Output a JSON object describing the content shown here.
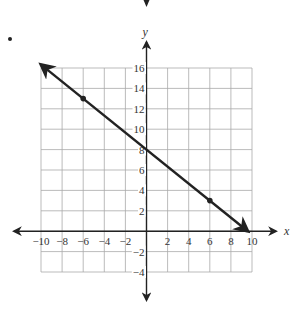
{
  "chart_data": {
    "type": "line",
    "title": "",
    "xlabel": "x",
    "ylabel": "y",
    "xlim": [
      -10,
      10
    ],
    "ylim": [
      -4,
      16
    ],
    "grid": true,
    "x_ticks": [
      -10,
      -8,
      -6,
      -4,
      -2,
      2,
      4,
      6,
      8,
      10
    ],
    "y_ticks": [
      -4,
      -2,
      2,
      4,
      6,
      8,
      10,
      12,
      14,
      16
    ],
    "x_tick_labels": [
      "−10",
      "−8",
      "−6",
      "−4",
      "−2",
      "2",
      "4",
      "6",
      "8",
      "10"
    ],
    "y_tick_labels": [
      "−4",
      "−2",
      "2",
      "4",
      "6",
      "8",
      "10",
      "12",
      "14",
      "16"
    ],
    "series": [
      {
        "name": "line",
        "slope": -0.8333,
        "intercept": 8,
        "marked_points": [
          {
            "x": -6,
            "y": 13
          },
          {
            "x": 6,
            "y": 3
          }
        ],
        "x": [
          -10,
          9.6
        ],
        "y": [
          16.33,
          0
        ],
        "arrow_both_ends": true
      }
    ]
  }
}
